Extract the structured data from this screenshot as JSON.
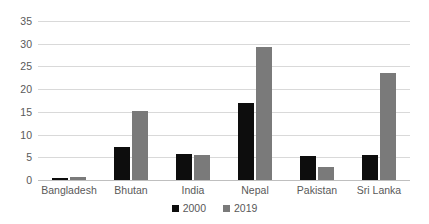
{
  "chart_data": {
    "type": "bar",
    "title": "",
    "subtitle": "",
    "xlabel": "",
    "ylabel": "",
    "categories": [
      "Bangladesh",
      "Bhutan",
      "India",
      "Nepal",
      "Pakistan",
      "Sri Lanka"
    ],
    "series": [
      {
        "name": "2000",
        "color": "#0d0d0d",
        "values": [
          0.4,
          7.2,
          5.8,
          16.9,
          5.2,
          5.6
        ]
      },
      {
        "name": "2019",
        "color": "#7a7a7a",
        "values": [
          0.7,
          15.3,
          5.6,
          29.3,
          2.9,
          23.6
        ]
      }
    ],
    "ylim": [
      0,
      35
    ],
    "ytick_step": 5,
    "yticks": [
      "0",
      "5",
      "10",
      "15",
      "20",
      "25",
      "30",
      "35"
    ],
    "grid": "horizontal",
    "legend_position": "bottom-center",
    "annotations": []
  },
  "axis": {
    "gridline_color": "#d9d9d9",
    "baseline_color": "#bfbfbf",
    "tick_text_color": "#595959"
  },
  "legend": {
    "items": [
      {
        "label": "2000",
        "color": "#0d0d0d"
      },
      {
        "label": "2019",
        "color": "#7a7a7a"
      }
    ]
  }
}
